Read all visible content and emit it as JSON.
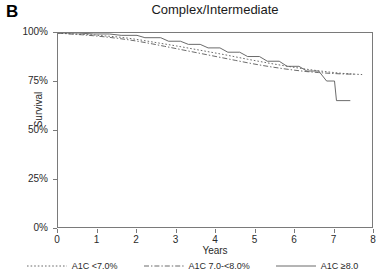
{
  "panel": {
    "letter": "B"
  },
  "chart_data": {
    "type": "line",
    "title": "Complex/Intermediate",
    "xlabel": "Years",
    "ylabel": "Survival",
    "xlim": [
      0,
      8
    ],
    "ylim": [
      0,
      100
    ],
    "grid": false,
    "legend_position": "bottom",
    "x_ticks": [
      "0",
      "1",
      "2",
      "3",
      "4",
      "5",
      "6",
      "7",
      "8"
    ],
    "x_tick_values": [
      0,
      1,
      2,
      3,
      4,
      5,
      6,
      7,
      8
    ],
    "y_ticks": [
      "0%",
      "25%",
      "50%",
      "75%",
      "100%"
    ],
    "y_tick_values": [
      0,
      25,
      50,
      75,
      100
    ],
    "series": [
      {
        "name": "A1C <7.0%",
        "style": "dotted",
        "color": "#5a5a5a",
        "points": [
          [
            0.0,
            100.0
          ],
          [
            0.3,
            99.6
          ],
          [
            0.6,
            99.3
          ],
          [
            0.9,
            99.0
          ],
          [
            1.2,
            98.5
          ],
          [
            1.5,
            98.0
          ],
          [
            1.8,
            97.3
          ],
          [
            2.1,
            96.4
          ],
          [
            2.4,
            95.4
          ],
          [
            2.7,
            94.4
          ],
          [
            3.0,
            93.4
          ],
          [
            3.3,
            92.3
          ],
          [
            3.6,
            91.2
          ],
          [
            3.9,
            90.1
          ],
          [
            4.2,
            89.0
          ],
          [
            4.5,
            87.8
          ],
          [
            4.8,
            86.6
          ],
          [
            5.1,
            85.5
          ],
          [
            5.4,
            84.4
          ],
          [
            5.7,
            83.4
          ],
          [
            6.0,
            82.4
          ],
          [
            6.3,
            81.5
          ],
          [
            6.6,
            80.7
          ],
          [
            6.9,
            80.0
          ],
          [
            7.2,
            79.4
          ],
          [
            7.5,
            79.0
          ],
          [
            7.7,
            78.8
          ]
        ]
      },
      {
        "name": "A1C 7.0-<8.0%",
        "style": "dashdot",
        "color": "#5a5a5a",
        "points": [
          [
            0.0,
            100.0
          ],
          [
            0.3,
            99.5
          ],
          [
            0.6,
            99.1
          ],
          [
            0.9,
            98.6
          ],
          [
            1.2,
            98.0
          ],
          [
            1.5,
            97.3
          ],
          [
            1.8,
            96.5
          ],
          [
            2.1,
            95.5
          ],
          [
            2.4,
            94.4
          ],
          [
            2.7,
            93.2
          ],
          [
            3.0,
            92.0
          ],
          [
            3.3,
            90.8
          ],
          [
            3.6,
            89.6
          ],
          [
            3.9,
            88.4
          ],
          [
            4.2,
            87.2
          ],
          [
            4.5,
            86.0
          ],
          [
            4.8,
            84.8
          ],
          [
            5.1,
            83.7
          ],
          [
            5.4,
            82.7
          ],
          [
            5.7,
            81.8
          ],
          [
            6.0,
            81.0
          ],
          [
            6.3,
            80.3
          ],
          [
            6.6,
            79.8
          ],
          [
            6.9,
            79.4
          ],
          [
            7.2,
            79.1
          ],
          [
            7.5,
            79.0
          ]
        ]
      },
      {
        "name": "A1C ≥8.0",
        "style": "solid",
        "color": "#5a5a5a",
        "points": [
          [
            0.0,
            100.0
          ],
          [
            0.5,
            100.0
          ],
          [
            0.9,
            99.5
          ],
          [
            1.3,
            99.5
          ],
          [
            1.6,
            98.8
          ],
          [
            2.0,
            98.8
          ],
          [
            2.2,
            97.6
          ],
          [
            2.6,
            97.6
          ],
          [
            2.8,
            95.8
          ],
          [
            3.1,
            95.8
          ],
          [
            3.3,
            94.2
          ],
          [
            3.6,
            94.2
          ],
          [
            3.8,
            92.4
          ],
          [
            4.1,
            92.4
          ],
          [
            4.3,
            90.2
          ],
          [
            4.6,
            90.2
          ],
          [
            4.8,
            88.0
          ],
          [
            5.1,
            88.0
          ],
          [
            5.3,
            85.6
          ],
          [
            5.6,
            85.6
          ],
          [
            5.8,
            83.0
          ],
          [
            6.1,
            83.0
          ],
          [
            6.3,
            80.6
          ],
          [
            6.6,
            80.6
          ],
          [
            6.8,
            75.5
          ],
          [
            7.0,
            75.5
          ],
          [
            7.05,
            65.5
          ],
          [
            7.4,
            65.5
          ]
        ]
      }
    ]
  }
}
